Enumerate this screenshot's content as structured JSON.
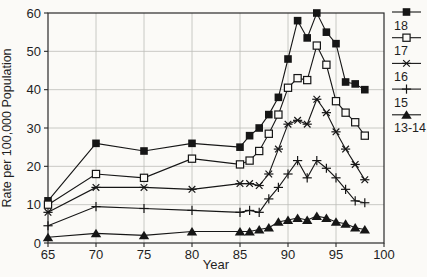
{
  "theme": {
    "background": "#fbfaf7",
    "axis_color": "#2a2a2a",
    "grid_color": "#bdbdb8",
    "series_color": "#161616",
    "text_color": "#1f1f1f"
  },
  "chart_data": {
    "type": "line",
    "title": "",
    "xlabel": "Year",
    "ylabel": "Rate per 100,000 Population",
    "xlim": [
      65,
      100
    ],
    "ylim": [
      0,
      60
    ],
    "xticks": [
      65,
      70,
      75,
      80,
      85,
      90,
      95,
      100
    ],
    "yticks": [
      0,
      10,
      20,
      30,
      40,
      50,
      60
    ],
    "grid": true,
    "legend_position": "right-outside",
    "x": [
      65,
      70,
      75,
      80,
      85,
      86,
      87,
      88,
      89,
      90,
      91,
      92,
      93,
      94,
      95,
      96,
      97,
      98
    ],
    "series": [
      {
        "name": "18",
        "marker": "square-filled",
        "values": [
          11,
          26,
          24,
          26,
          25,
          28,
          30,
          33.5,
          38,
          48,
          58,
          53.5,
          60,
          55,
          52,
          42,
          41.5,
          40
        ]
      },
      {
        "name": "17",
        "marker": "square-open",
        "values": [
          10,
          18,
          17,
          22,
          20.5,
          21.5,
          24,
          28.5,
          33.5,
          40.5,
          43,
          42.5,
          51.5,
          46.5,
          37,
          34,
          31.5,
          28
        ]
      },
      {
        "name": "16",
        "marker": "asterisk",
        "values": [
          8,
          14.5,
          14.5,
          14,
          15.5,
          15.5,
          15,
          18,
          24.5,
          31,
          32,
          31,
          37.5,
          34,
          29,
          24.5,
          20.5,
          16.5
        ]
      },
      {
        "name": "15",
        "marker": "plus",
        "values": [
          4.5,
          9.5,
          9,
          8.5,
          8,
          8.5,
          8,
          11.5,
          14.5,
          18,
          21.5,
          17,
          21.5,
          19.5,
          17,
          14,
          11,
          10.5
        ]
      },
      {
        "name": "13-14",
        "marker": "triangle-filled",
        "values": [
          1.5,
          2.5,
          2,
          3,
          3,
          3,
          3.5,
          4,
          5.5,
          6,
          6.5,
          6,
          7,
          6.5,
          5.5,
          5,
          4,
          3.5
        ]
      }
    ]
  }
}
